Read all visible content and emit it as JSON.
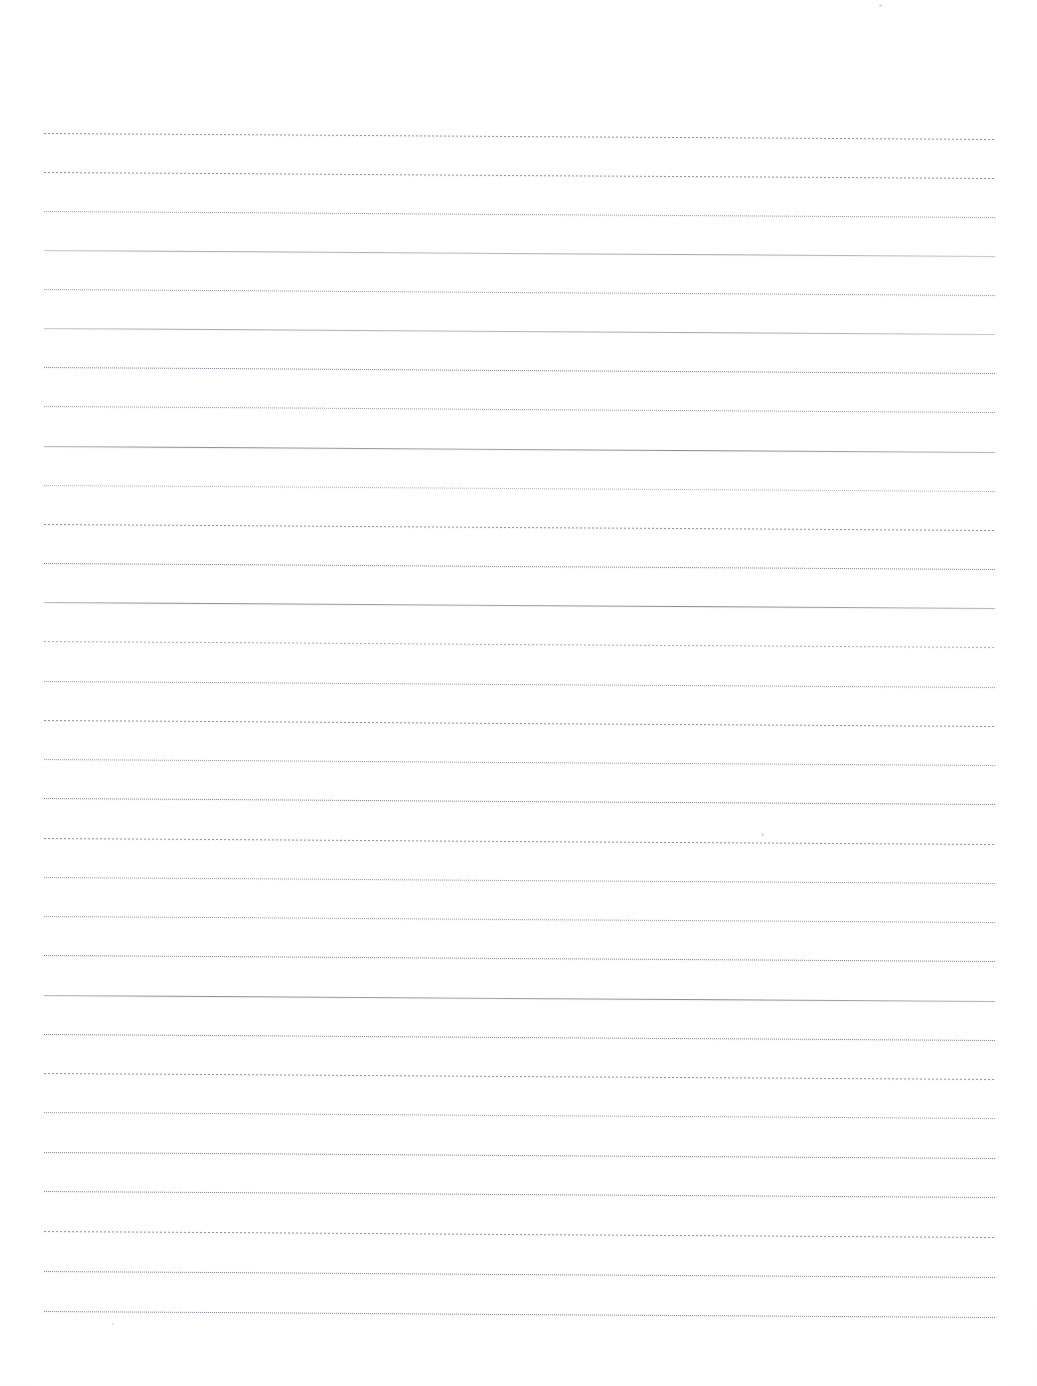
{
  "document": {
    "kind": "scanned-lined-paper",
    "title": "Blank ruled notebook page",
    "page_width": 1037,
    "page_height": 1386,
    "background_color": "#ffffff",
    "ink_color": "#5a5f69",
    "written_content": "",
    "margin_rule": "none",
    "header_text": "",
    "footer_text": ""
  },
  "ruling": {
    "line_count": 31,
    "first_line_y": 133,
    "line_spacing": 39.3,
    "line_start_x": 44,
    "line_end_x": 995,
    "line_length": 951,
    "skew_degrees": 0.36,
    "top_margin": 133,
    "bottom_margin": 74,
    "left_margin": 44,
    "right_margin": 42
  },
  "lines": [
    {
      "index": 1,
      "y": 133,
      "style": "dashed",
      "weight": "medium"
    },
    {
      "index": 2,
      "y": 172,
      "style": "dashed",
      "weight": "medium"
    },
    {
      "index": 3,
      "y": 211,
      "style": "dotted",
      "weight": "medium"
    },
    {
      "index": 4,
      "y": 250,
      "style": "solid",
      "weight": "light"
    },
    {
      "index": 5,
      "y": 289,
      "style": "dotted",
      "weight": "medium"
    },
    {
      "index": 6,
      "y": 328,
      "style": "solid",
      "weight": "light"
    },
    {
      "index": 7,
      "y": 367,
      "style": "dotted",
      "weight": "dark"
    },
    {
      "index": 8,
      "y": 406,
      "style": "dotted",
      "weight": "medium"
    },
    {
      "index": 9,
      "y": 446,
      "style": "solid",
      "weight": "medium"
    },
    {
      "index": 10,
      "y": 485,
      "style": "dotted",
      "weight": "light"
    },
    {
      "index": 11,
      "y": 524,
      "style": "dashed",
      "weight": "medium"
    },
    {
      "index": 12,
      "y": 563,
      "style": "dotted",
      "weight": "dark"
    },
    {
      "index": 13,
      "y": 602,
      "style": "solid",
      "weight": "medium"
    },
    {
      "index": 14,
      "y": 641,
      "style": "dashed",
      "weight": "light"
    },
    {
      "index": 15,
      "y": 681,
      "style": "dotted",
      "weight": "medium"
    },
    {
      "index": 16,
      "y": 720,
      "style": "dashed",
      "weight": "medium"
    },
    {
      "index": 17,
      "y": 759,
      "style": "dotted",
      "weight": "medium"
    },
    {
      "index": 18,
      "y": 798,
      "style": "dotted",
      "weight": "dark"
    },
    {
      "index": 19,
      "y": 838,
      "style": "dashed",
      "weight": "medium"
    },
    {
      "index": 20,
      "y": 877,
      "style": "dotted",
      "weight": "medium"
    },
    {
      "index": 21,
      "y": 916,
      "style": "dotted",
      "weight": "medium"
    },
    {
      "index": 22,
      "y": 955,
      "style": "dotted",
      "weight": "dark"
    },
    {
      "index": 23,
      "y": 995,
      "style": "solid",
      "weight": "medium"
    },
    {
      "index": 24,
      "y": 1034,
      "style": "dotted",
      "weight": "dark"
    },
    {
      "index": 25,
      "y": 1073,
      "style": "dashed",
      "weight": "medium"
    },
    {
      "index": 26,
      "y": 1112,
      "style": "dotted",
      "weight": "medium"
    },
    {
      "index": 27,
      "y": 1152,
      "style": "dotted",
      "weight": "dark"
    },
    {
      "index": 28,
      "y": 1191,
      "style": "dotted",
      "weight": "dark"
    },
    {
      "index": 29,
      "y": 1231,
      "style": "dashed",
      "weight": "medium"
    },
    {
      "index": 30,
      "y": 1271,
      "style": "dotted",
      "weight": "dark"
    },
    {
      "index": 31,
      "y": 1311,
      "style": "dotted",
      "weight": "dark"
    }
  ],
  "specks": [
    {
      "x": 879,
      "y": 4,
      "size": 3
    },
    {
      "x": 761,
      "y": 833,
      "size": 3
    },
    {
      "x": 112,
      "y": 1323,
      "size": 2
    }
  ]
}
